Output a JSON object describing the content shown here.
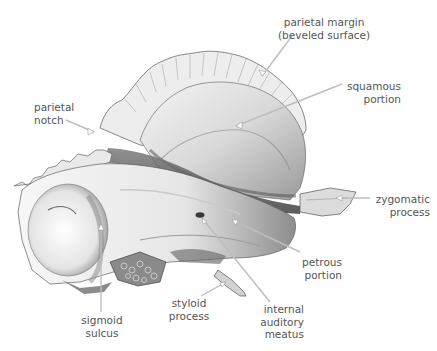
{
  "figure": {
    "label_color": "#555555",
    "leader_color": "#bdbdbd"
  },
  "labels": {
    "parietal_margin": {
      "line1": "parietal margin",
      "line2": "(beveled surface)"
    },
    "squamous_portion": {
      "line1": "squamous",
      "line2": "portion"
    },
    "parietal_notch": {
      "line1": "parietal",
      "line2": "notch"
    },
    "zygomatic_process": {
      "line1": "zygomatic",
      "line2": "process"
    },
    "petrous_portion": {
      "line1": "petrous",
      "line2": "portion"
    },
    "sigmoid_sulcus": {
      "line1": "sigmoid",
      "line2": "sulcus"
    },
    "styloid_process": {
      "line1": "styloid",
      "line2": "process"
    },
    "internal_auditory_meatus": {
      "line1": "internal",
      "line2": "auditory",
      "line3": "meatus"
    }
  }
}
